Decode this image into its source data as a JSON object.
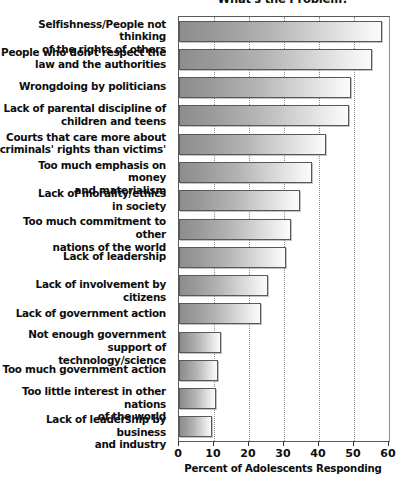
{
  "chart_data": {
    "type": "bar",
    "orientation": "horizontal",
    "title": "What's the Problem?",
    "xlabel": "Percent of Adolescents Responding",
    "ylabel": "",
    "xlim": [
      0,
      60
    ],
    "xticks": [
      0,
      10,
      20,
      30,
      40,
      50,
      60
    ],
    "xtick_labels": [
      "0",
      "10",
      "20",
      "30",
      "40",
      "50",
      "60"
    ],
    "grid": "vertical-dotted",
    "legend": "none",
    "categories": [
      "Selfishness/People not thinking of the rights of others",
      "People who don't respect the law and the authorities",
      "Wrongdoing by politicians",
      "Lack of parental discipline of children and teens",
      "Courts that care more about criminals' rights than victims'",
      "Too much emphasis on money and materialism",
      "Lack of morality/ethics in society",
      "Too much commitment to other nations of the world",
      "Lack of leadership",
      "Lack of involvement by citizens",
      "Lack of government action",
      "Not enough government support of technology/science",
      "Too much government action",
      "Too little interest in other nations of the world",
      "Lack of leadership by business and industry"
    ],
    "values": [
      58,
      55,
      49,
      48.5,
      42,
      38,
      34.5,
      32,
      30.5,
      25.5,
      23.5,
      12,
      11,
      10.5,
      9.5
    ],
    "bar_color_left": "#8d8d8d",
    "bar_color_right": "#fbfbfb",
    "bar_edge_color": "#585858"
  },
  "labels": [
    {
      "lines": [
        "Selfishness/People not thinking",
        "of the rights of others"
      ]
    },
    {
      "lines": [
        "People who don't respect the",
        "law and the authorities"
      ]
    },
    {
      "lines": [
        "Wrongdoing by politicians"
      ]
    },
    {
      "lines": [
        "Lack of parental discipline of",
        "children and teens"
      ]
    },
    {
      "lines": [
        "Courts that care more about",
        "criminals' rights than victims'"
      ]
    },
    {
      "lines": [
        "Too much emphasis on money",
        "and materialism"
      ]
    },
    {
      "lines": [
        "Lack of morality/ethics",
        "in society"
      ]
    },
    {
      "lines": [
        "Too much commitment to other",
        "nations of the world"
      ]
    },
    {
      "lines": [
        "Lack of leadership"
      ]
    },
    {
      "lines": [
        "Lack of involvement by citizens"
      ]
    },
    {
      "lines": [
        "Lack of government action"
      ]
    },
    {
      "lines": [
        "Not enough government",
        "support of technology/science"
      ]
    },
    {
      "lines": [
        "Too much government action"
      ]
    },
    {
      "lines": [
        "Too little interest in other nations",
        "of the world"
      ]
    },
    {
      "lines": [
        "Lack of leadership by business",
        "and industry"
      ]
    }
  ]
}
